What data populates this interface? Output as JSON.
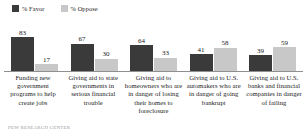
{
  "legend": {
    "items": [
      {
        "label": "% Favor",
        "color": "#3a3a3a",
        "icon": "legend-swatch-favor"
      },
      {
        "label": "% Oppose",
        "color": "#c8c8c8",
        "icon": "legend-swatch-oppose"
      }
    ]
  },
  "colors": {
    "favor": "#3a3a3a",
    "oppose": "#c8c8c8",
    "baseline": "#8f8f8f",
    "text": "#1a1a1a",
    "background": "#ffffff"
  },
  "footnote": {
    "text": "PEW RESEARCH CENTER"
  },
  "chart_data": {
    "type": "bar",
    "title": "",
    "subtitle": "",
    "xlabel": "",
    "ylabel": "",
    "ylim": [
      0,
      100
    ],
    "grid": false,
    "legend_position": "top-left",
    "orientation": "vertical",
    "grouping": "grouped",
    "categories": [
      "Funding new government programs to help create jobs",
      "Giving aid to state governments in serious financial trouble",
      "Giving aid to homeowners who are in danger of losing their homes to foreclosure",
      "Giving aid to U.S. automakers who are in danger of going bankrupt",
      "Giving aid to U.S. banks and financial companies in danger of failing"
    ],
    "series": [
      {
        "name": "% Favor",
        "color": "#3a3a3a",
        "values": [
          83,
          67,
          64,
          41,
          39
        ]
      },
      {
        "name": "% Oppose",
        "color": "#c8c8c8",
        "values": [
          17,
          30,
          33,
          58,
          59
        ]
      }
    ]
  }
}
